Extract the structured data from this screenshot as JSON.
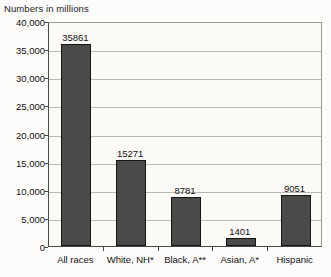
{
  "chart_data": {
    "type": "bar",
    "title": "Numbers in millions",
    "xlabel": "",
    "ylabel": "",
    "categories": [
      "All races",
      "White, NH*",
      "Black, A**",
      "Asian, A*",
      "Hispanic"
    ],
    "values": [
      35861,
      15271,
      8781,
      1401,
      9051
    ],
    "data_labels": [
      "35861",
      "15271",
      "8781",
      "1401",
      "9051"
    ],
    "ylim": [
      0,
      40000
    ],
    "ytick_values": [
      0,
      5000,
      10000,
      15000,
      20000,
      25000,
      30000,
      35000,
      40000
    ],
    "ytick_labels": [
      "0",
      "5,000",
      "10,000",
      "15,000",
      "20,000",
      "25,000",
      "30,000",
      "35,000",
      "40,000"
    ],
    "grid": true,
    "legend": false,
    "bar_color": "#4a4a48",
    "bar_border_color": "#151515",
    "gridline_color": "#b9b9b4",
    "axis_color": "#4a4a48",
    "plot_background": "#fbfaf7",
    "page_background": "#fdfcfa"
  }
}
